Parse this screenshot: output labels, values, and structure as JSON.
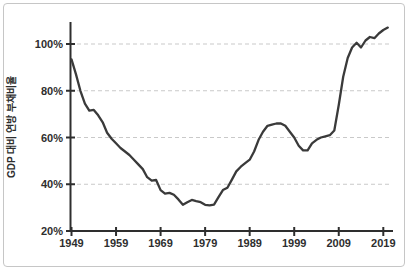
{
  "window": {
    "background": "#ffffff",
    "border_color": "#c6c6c6"
  },
  "chart_data": {
    "type": "line",
    "title": "",
    "xlabel": "",
    "ylabel": "GDP 대비 연방 부채비율",
    "y_tick_suffix": "%",
    "x_ticks": [
      1949,
      1959,
      1969,
      1979,
      1989,
      1999,
      2009,
      2019
    ],
    "y_ticks": [
      20,
      40,
      60,
      80,
      100
    ],
    "xlim": [
      1949,
      2021
    ],
    "ylim": [
      20,
      110
    ],
    "grid": "horizontal-dashed",
    "legend_position": "none",
    "line_color": "#3a3a3a",
    "grid_color": "#c9c9c9",
    "axis_color": "#2e2e2e",
    "series": [
      {
        "name": "GDP 대비 연방 부채비율",
        "x": [
          1949,
          1950,
          1951,
          1952,
          1953,
          1954,
          1955,
          1956,
          1957,
          1958,
          1959,
          1960,
          1961,
          1962,
          1963,
          1964,
          1965,
          1966,
          1967,
          1968,
          1969,
          1970,
          1971,
          1972,
          1973,
          1974,
          1975,
          1976,
          1977,
          1978,
          1979,
          1980,
          1981,
          1982,
          1983,
          1984,
          1985,
          1986,
          1987,
          1988,
          1989,
          1990,
          1991,
          1992,
          1993,
          1994,
          1995,
          1996,
          1997,
          1998,
          1999,
          2000,
          2001,
          2002,
          2003,
          2004,
          2005,
          2006,
          2007,
          2008,
          2009,
          2010,
          2011,
          2012,
          2013,
          2014,
          2015,
          2016,
          2017,
          2018,
          2019,
          2020
        ],
        "values": [
          93.4,
          87,
          80,
          74.5,
          71.5,
          71.8,
          69.5,
          66.5,
          62,
          59.5,
          57.5,
          55.5,
          54,
          52.5,
          50.5,
          48.5,
          46.5,
          43,
          41.5,
          41.8,
          37.5,
          36,
          36.3,
          35.5,
          33.5,
          31.2,
          32.3,
          33.3,
          32.8,
          32.3,
          31.2,
          31,
          31.3,
          34.5,
          37.5,
          38.5,
          42,
          45.5,
          47.5,
          49,
          50.5,
          54,
          59,
          62.5,
          65,
          65.5,
          66,
          66,
          65,
          62.5,
          60,
          56.5,
          54.5,
          54.5,
          57.5,
          59,
          60,
          60.5,
          61,
          63,
          74,
          86,
          94,
          98.5,
          100.5,
          98.5,
          101.5,
          103,
          102.5,
          104.5,
          106,
          107
        ]
      }
    ]
  }
}
